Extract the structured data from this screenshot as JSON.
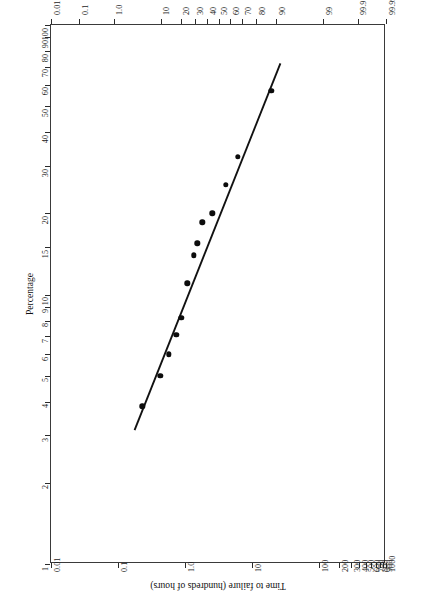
{
  "figure": {
    "background": "#ffffff",
    "frame_color": "#3a3a3a",
    "point_color": "#0c0c0c",
    "line_color": "#111111",
    "orientation": "rotated-90",
    "percent_axis_title": "Percentage",
    "hazard_axis_title": "Cumulative hazard",
    "time_axis_title": "Time to failure (hundreds of hours)"
  },
  "chart_data": {
    "type": "scatter",
    "title": "",
    "subtitle": "",
    "xlabel": "Percentage",
    "ylabel": "Time to failure (hundreds of hours)",
    "secondary_xlabel": "Cumulative hazard",
    "grid": false,
    "legend": "none",
    "percent_axis": {
      "scale": "normal-probability",
      "lim": [
        0.01,
        99.99
      ],
      "ticks": [
        "0.01",
        "0.1",
        "1.0",
        "10",
        "20",
        "30",
        "40",
        "50",
        "60",
        "70",
        "80",
        "90",
        "99",
        "99.9",
        "99.99"
      ],
      "tick_values": [
        0.01,
        0.1,
        1.0,
        10,
        20,
        30,
        40,
        50,
        60,
        70,
        80,
        90,
        99,
        99.9,
        99.99
      ]
    },
    "hazard_axis": {
      "scale": "log",
      "lim": [
        0.01,
        1000
      ],
      "ticks": [
        "0.01",
        "0.1",
        "1.0",
        "10",
        "100",
        "200",
        "300",
        "400",
        "500",
        "600",
        "700",
        "800",
        "900",
        "1000"
      ],
      "tick_values": [
        0.01,
        0.1,
        1.0,
        10,
        100,
        200,
        300,
        400,
        500,
        600,
        700,
        800,
        900,
        1000
      ]
    },
    "time_axis": {
      "scale": "log",
      "lim": [
        1,
        100
      ],
      "ticks": [
        "100",
        "90",
        "80",
        "70",
        "60",
        "50",
        "40",
        "30",
        "20",
        "15",
        "10",
        "9",
        "8",
        "7",
        "6",
        "5",
        "4",
        "3",
        "2",
        "1"
      ],
      "tick_values": [
        100,
        90,
        80,
        70,
        60,
        50,
        40,
        30,
        20,
        15,
        10,
        9,
        8,
        7,
        6,
        5,
        4,
        3,
        2,
        1
      ]
    },
    "series": [
      {
        "name": "Failure data",
        "marker": "filled-circle",
        "percent": [
          88.0,
          66.5,
          56.5,
          44.5,
          36.0,
          32.0,
          29.0,
          24.5,
          20.5,
          17.5,
          13.5,
          9.8,
          4.5
        ],
        "time": [
          57.0,
          32.5,
          25.5,
          20.0,
          18.5,
          15.5,
          14.0,
          11.0,
          8.2,
          7.1,
          6.0,
          5.0,
          3.85
        ],
        "points": [
          {
            "percent": 88.0,
            "time": 57.0
          },
          {
            "percent": 66.5,
            "time": 32.5
          },
          {
            "percent": 56.5,
            "time": 25.5
          },
          {
            "percent": 44.5,
            "time": 20.0
          },
          {
            "percent": 36.0,
            "time": 18.5
          },
          {
            "percent": 32.0,
            "time": 15.5
          },
          {
            "percent": 29.0,
            "time": 14.0
          },
          {
            "percent": 24.5,
            "time": 11.0
          },
          {
            "percent": 20.5,
            "time": 8.2
          },
          {
            "percent": 17.5,
            "time": 7.1
          },
          {
            "percent": 13.5,
            "time": 6.0
          },
          {
            "percent": 9.8,
            "time": 5.0
          },
          {
            "percent": 4.5,
            "time": 3.85
          }
        ]
      },
      {
        "name": "Fitted line",
        "marker": "none",
        "style": "solid",
        "endpoints": [
          {
            "percent": 92.0,
            "time": 72.0
          },
          {
            "percent": 3.2,
            "time": 3.1
          }
        ]
      }
    ]
  }
}
